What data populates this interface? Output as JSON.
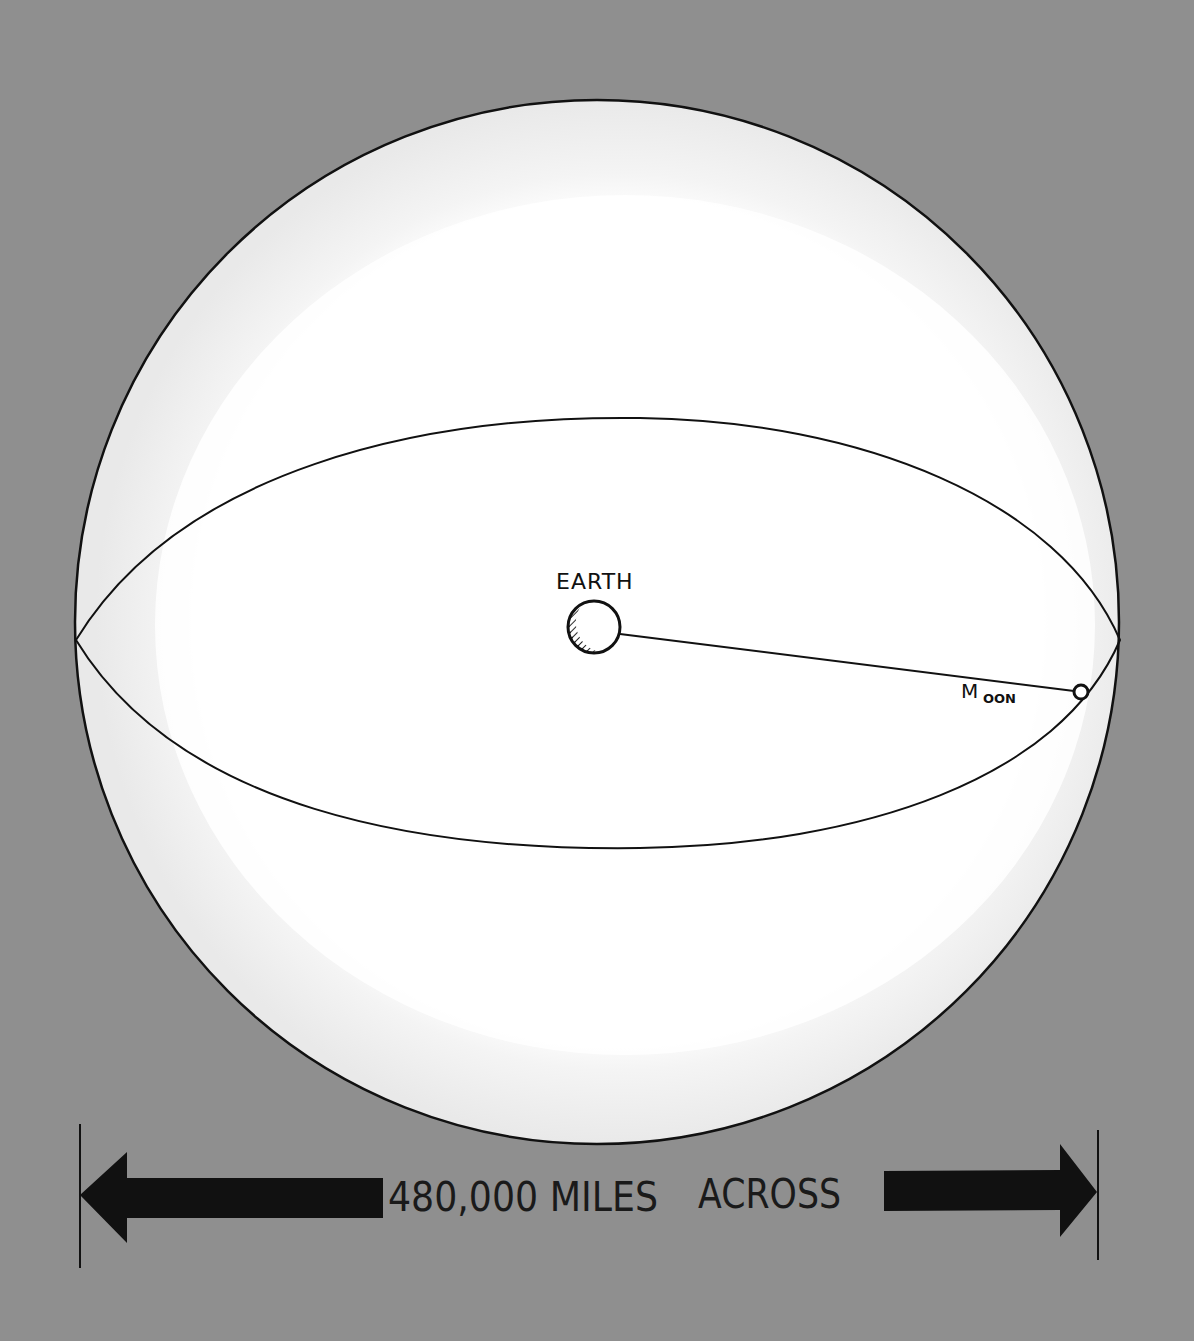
{
  "diagram": {
    "background_color": "#8f8f8f",
    "sphere": {
      "name": "Earth's sphere of influence (moon orbit sphere)",
      "fill_outer": "#eeeeee",
      "fill_inner": "#ffffff",
      "outline_color": "#111111"
    },
    "labels": {
      "earth": "EARTH",
      "moon_first_letter": "M",
      "moon_rest": "OON"
    },
    "dimension": {
      "label_part1": "480,000 MILES",
      "label_part2": "ACROSS",
      "arrow_color": "#111111"
    }
  }
}
